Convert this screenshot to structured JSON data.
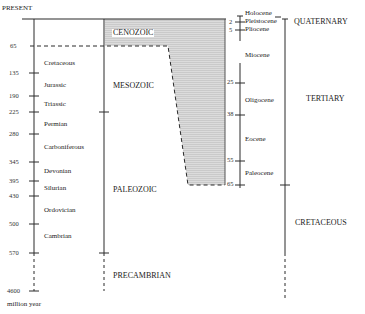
{
  "diagram": {
    "top_label": "PRESENT",
    "unit_label": "million year",
    "eras": [
      {
        "name": "CENOZOIC"
      },
      {
        "name": "MESOZOIC"
      },
      {
        "name": "PALEOZOIC"
      },
      {
        "name": "PRECAMBRIAN"
      }
    ],
    "left_ticks": [
      "65",
      "135",
      "190",
      "225",
      "280",
      "345",
      "395",
      "430",
      "500",
      "570",
      "4600"
    ],
    "periods_left": [
      {
        "name": "Cretaceous"
      },
      {
        "name": "Jurassic"
      },
      {
        "name": "Triassic"
      },
      {
        "name": "Permian"
      },
      {
        "name": "Carboniferous"
      },
      {
        "name": "Devonian"
      },
      {
        "name": "Silurian"
      },
      {
        "name": "Ordovician"
      },
      {
        "name": "Cambrian"
      }
    ],
    "epoch_ticks": [
      "2",
      "5",
      "25",
      "38",
      "55",
      "65"
    ],
    "epochs": [
      {
        "name": "Holocene"
      },
      {
        "name": "Pleistocene"
      },
      {
        "name": "Pliocene"
      },
      {
        "name": "Miocene"
      },
      {
        "name": "Oligocene"
      },
      {
        "name": "Eocene"
      },
      {
        "name": "Paleocene"
      }
    ],
    "periods_right": [
      {
        "name": "QUATERNARY"
      },
      {
        "name": "TERTIARY"
      },
      {
        "name": "CRETACEOUS"
      }
    ],
    "colors": {
      "line": "#2a2a2a",
      "shade": "#d4d4d4"
    }
  }
}
